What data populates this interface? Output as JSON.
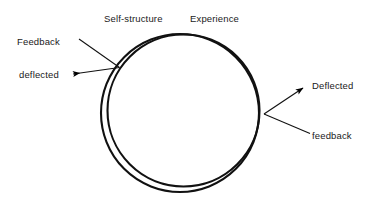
{
  "diagram": {
    "type": "concept-diagram",
    "title_visible": false,
    "background_color": "#ffffff",
    "stroke_color": "#000000",
    "text_color": "#1a1a1a",
    "labels": {
      "self_structure": "Self-structure",
      "experience": "Experience",
      "feedback_left": "Feedback",
      "deflected_left": "deflected",
      "deflected_right": "Deflected",
      "feedback_right": "feedback"
    },
    "shapes": {
      "circle_outer": {
        "cx": 180,
        "cy": 113,
        "r": 79
      },
      "circle_inner": {
        "cx": 183,
        "cy": 111,
        "r": 76
      }
    },
    "arrows": {
      "left": {
        "label_top": "Feedback",
        "label_bottom": "deflected",
        "path": "M 78 38 L 119 67 L 70 74",
        "arrowhead_at": "deflected",
        "arrowhead_x": 68,
        "arrowhead_y": 74
      },
      "right_up": {
        "label": "Deflected",
        "path": "M 264 114 L 306 86",
        "arrowhead_at": "Deflected",
        "arrowhead_x": 307,
        "arrowhead_y": 85
      },
      "right_down": {
        "label": "feedback",
        "path": "M 264 114 L 309 133",
        "arrowhead_at": "none"
      }
    }
  }
}
